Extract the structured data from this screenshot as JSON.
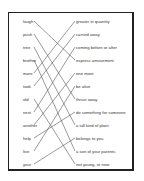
{
  "worksheet": {
    "left_words": [
      "laugh",
      "push",
      "tree",
      "brother",
      "more",
      "took",
      "old",
      "next",
      "another",
      "help",
      "live",
      "your"
    ],
    "right_definitions": [
      "greater in quantity",
      "carried away",
      "coming before or after",
      "express amusement",
      "one more",
      "be alive",
      "thrust away",
      "do something for someone",
      "a tall kind of plant",
      "belongs to you",
      "a son of your parents",
      "not young, or new"
    ],
    "matches": [
      {
        "left": 0,
        "right": 3
      },
      {
        "left": 1,
        "right": 6
      },
      {
        "left": 2,
        "right": 8
      },
      {
        "left": 3,
        "right": 10
      },
      {
        "left": 4,
        "right": 0
      },
      {
        "left": 5,
        "right": 1
      },
      {
        "left": 6,
        "right": 11
      },
      {
        "left": 7,
        "right": 2
      },
      {
        "left": 8,
        "right": 4
      },
      {
        "left": 9,
        "right": 7
      },
      {
        "left": 10,
        "right": 5
      },
      {
        "left": 11,
        "right": 9
      }
    ],
    "line_color": "#555555",
    "border_color": "#222222"
  }
}
